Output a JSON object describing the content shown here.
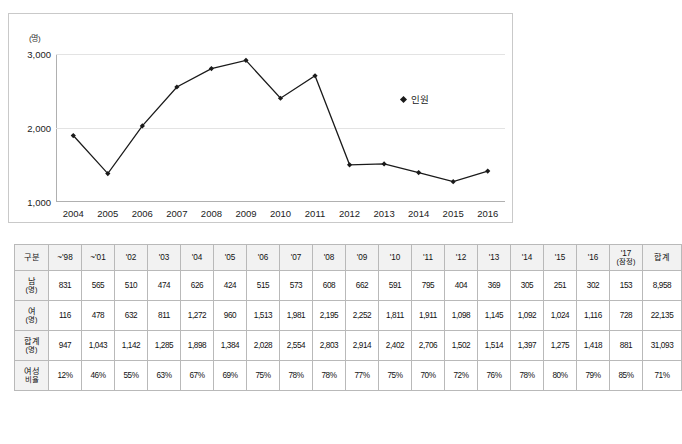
{
  "chart_data": {
    "type": "line",
    "title": "",
    "xlabel": "",
    "ylabel": "(명)",
    "ylim": [
      1000,
      3000
    ],
    "yticks": [
      "1,000",
      "2,000",
      "3,000"
    ],
    "ytick_values": [
      1000,
      2000,
      3000
    ],
    "grid": true,
    "legend_position": "right",
    "categories": [
      "2004",
      "2005",
      "2006",
      "2007",
      "2008",
      "2009",
      "2010",
      "2011",
      "2012",
      "2013",
      "2014",
      "2015",
      "2016"
    ],
    "series": [
      {
        "name": "인원",
        "values": [
          1898,
          1384,
          2028,
          2554,
          2803,
          2914,
          2402,
          2706,
          1502,
          1514,
          1397,
          1275,
          1418
        ]
      }
    ]
  },
  "legend": {
    "marker": "diamond-marker",
    "label": "인원"
  },
  "table": {
    "columns": [
      "구분",
      "~'98",
      "~'01",
      "'02",
      "'03",
      "'04",
      "'05",
      "'06",
      "'07",
      "'08",
      "'09",
      "'10",
      "'11",
      "'12",
      "'13",
      "'14",
      "'15",
      "'16"
    ],
    "col_17_main": "'17",
    "col_17_sub": "(잠정)",
    "col_total": "합계",
    "rows": [
      {
        "head_main": "남",
        "head_sub": "(명)",
        "values": [
          "831",
          "565",
          "510",
          "474",
          "626",
          "424",
          "515",
          "573",
          "608",
          "662",
          "591",
          "795",
          "404",
          "369",
          "305",
          "251",
          "302",
          "153"
        ],
        "total": "8,958"
      },
      {
        "head_main": "여",
        "head_sub": "(명)",
        "values": [
          "116",
          "478",
          "632",
          "811",
          "1,272",
          "960",
          "1,513",
          "1,981",
          "2,195",
          "2,252",
          "1,811",
          "1,911",
          "1,098",
          "1,145",
          "1,092",
          "1,024",
          "1,116",
          "728"
        ],
        "total": "22,135"
      },
      {
        "head_main": "합계",
        "head_sub": "(명)",
        "values": [
          "947",
          "1,043",
          "1,142",
          "1,285",
          "1,898",
          "1,384",
          "2,028",
          "2,554",
          "2,803",
          "2,914",
          "2,402",
          "2,706",
          "1,502",
          "1,514",
          "1,397",
          "1,275",
          "1,418",
          "881"
        ],
        "total": "31,093"
      },
      {
        "head_main": "여성",
        "head_sub": "비율",
        "values": [
          "12%",
          "46%",
          "55%",
          "63%",
          "67%",
          "69%",
          "75%",
          "78%",
          "78%",
          "77%",
          "75%",
          "70%",
          "72%",
          "76%",
          "78%",
          "80%",
          "79%",
          "85%"
        ],
        "total": "71%"
      }
    ]
  },
  "colors": {
    "series": "#1a1a1a",
    "grid": "#e3e3e3",
    "axis": "#b0b0b0",
    "header_bg": "#f2f2f2",
    "border": "#b9b9b9"
  }
}
